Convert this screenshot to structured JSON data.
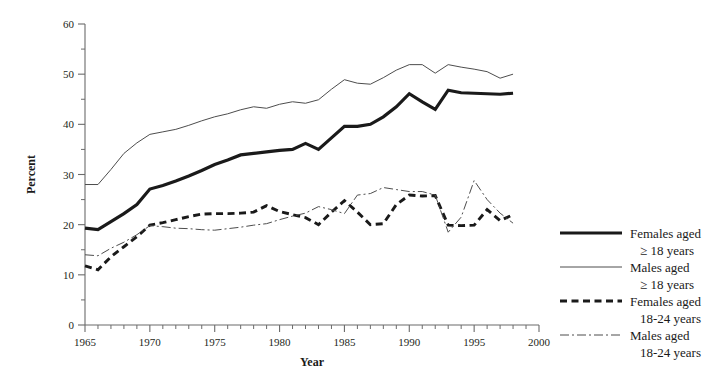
{
  "chart_data": {
    "type": "line",
    "title": "",
    "xlabel": "Year",
    "ylabel": "Percent",
    "xlim": [
      1965,
      2000
    ],
    "ylim": [
      0,
      60
    ],
    "ytick_step": 10,
    "yticks": [
      0,
      10,
      20,
      30,
      40,
      50,
      60
    ],
    "ytick_labels": [
      "0",
      "10",
      "20",
      "30",
      "40",
      "50",
      "60"
    ],
    "xticks": [
      1965,
      1970,
      1975,
      1980,
      1985,
      1990,
      1995,
      2000
    ],
    "xtick_labels": [
      "1965",
      "1970",
      "1975",
      "1980",
      "1985",
      "1990",
      "1995",
      "2000"
    ],
    "x_minor_tick_step": 1,
    "grid": false,
    "legend_position": "right",
    "x": [
      1965,
      1966,
      1967,
      1968,
      1969,
      1970,
      1971,
      1972,
      1973,
      1974,
      1975,
      1976,
      1977,
      1978,
      1979,
      1980,
      1981,
      1982,
      1983,
      1984,
      1985,
      1986,
      1987,
      1988,
      1989,
      1990,
      1991,
      1992,
      1993,
      1994,
      1995,
      1996,
      1997,
      1998
    ],
    "series": [
      {
        "name": "Females aged ≥ 18 years",
        "style": "thick-solid",
        "color": "#1a1a1a",
        "values": [
          19.3,
          19.0,
          20.6,
          22.2,
          24.0,
          27.1,
          27.8,
          28.7,
          29.7,
          30.8,
          32.0,
          32.9,
          33.9,
          34.2,
          34.5,
          34.8,
          35.0,
          36.2,
          35.0,
          37.3,
          39.6,
          39.6,
          40.0,
          41.5,
          43.5,
          46.1,
          44.5,
          43.0,
          46.8,
          46.3,
          46.2,
          46.1,
          46.0,
          46.2
        ]
      },
      {
        "name": "Males aged ≥ 18 years",
        "style": "thin-solid",
        "color": "#4d4d4d",
        "values": [
          28.0,
          28.0,
          31.0,
          34.2,
          36.3,
          38.0,
          38.5,
          39.0,
          39.8,
          40.7,
          41.5,
          42.1,
          42.9,
          43.5,
          43.2,
          44.0,
          44.5,
          44.2,
          44.9,
          47.0,
          48.9,
          48.2,
          48.0,
          49.3,
          50.8,
          51.9,
          51.9,
          50.2,
          51.9,
          51.4,
          51.0,
          50.5,
          49.2,
          50.0
        ]
      },
      {
        "name": "Females aged 18-24 years",
        "style": "thick-dashed",
        "color": "#1a1a1a",
        "values": [
          11.8,
          11.0,
          13.6,
          15.6,
          17.6,
          19.9,
          20.4,
          21.0,
          21.6,
          22.1,
          22.2,
          22.2,
          22.3,
          22.5,
          23.8,
          22.6,
          22.0,
          21.4,
          20.0,
          22.5,
          24.8,
          22.5,
          20.0,
          20.2,
          24.0,
          25.9,
          25.7,
          25.8,
          19.9,
          19.8,
          19.9,
          23.0,
          20.8,
          22.0
        ]
      },
      {
        "name": "Males aged 18-24 years",
        "style": "thin-dashdot",
        "color": "#4d4d4d",
        "values": [
          14.0,
          13.8,
          15.3,
          16.5,
          18.0,
          19.8,
          19.6,
          19.3,
          19.2,
          19.0,
          18.9,
          19.2,
          19.5,
          19.9,
          20.2,
          21.0,
          21.7,
          22.3,
          23.6,
          23.0,
          22.2,
          25.9,
          26.2,
          27.4,
          27.0,
          26.6,
          26.6,
          25.9,
          18.5,
          21.5,
          28.8,
          25.0,
          22.3,
          20.3
        ]
      }
    ]
  },
  "legend": {
    "entries": [
      {
        "label_line1": "Females aged",
        "label_line2": "≥ 18 years",
        "style": "thick-solid"
      },
      {
        "label_line1": "Males aged",
        "label_line2": "≥ 18 years",
        "style": "thin-solid"
      },
      {
        "label_line1": "Females aged",
        "label_line2": "18-24 years",
        "style": "thick-dashed"
      },
      {
        "label_line1": "Males aged",
        "label_line2": "18-24 years",
        "style": "thin-dashdot"
      }
    ]
  }
}
